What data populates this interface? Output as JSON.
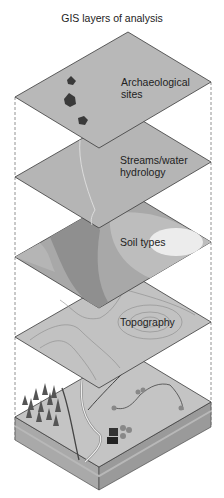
{
  "title": "GIS layers of analysis",
  "layers": [
    {
      "id": "archaeological",
      "label_line1": "Archaeological",
      "label_line2": "sites",
      "fill": "#b8b8b8"
    },
    {
      "id": "streams",
      "label_line1": "Streams/water",
      "label_line2": "hydrology",
      "fill": "#b5b5b5"
    },
    {
      "id": "soil",
      "label_line1": "Soil types",
      "fill": "#a8a8a8"
    },
    {
      "id": "topography",
      "label_line1": "Topography",
      "fill": "#c2c2c2"
    },
    {
      "id": "landscape",
      "label_line1": "",
      "fill": "#c4c4c4"
    }
  ],
  "colors": {
    "edge": "#3a3a3a",
    "dashed_guide": "#777777",
    "site_marker": "#3a3a3a",
    "soil_dark": "#8f8f8f",
    "soil_light": "#ececec",
    "contour": "#8a8a8a"
  }
}
